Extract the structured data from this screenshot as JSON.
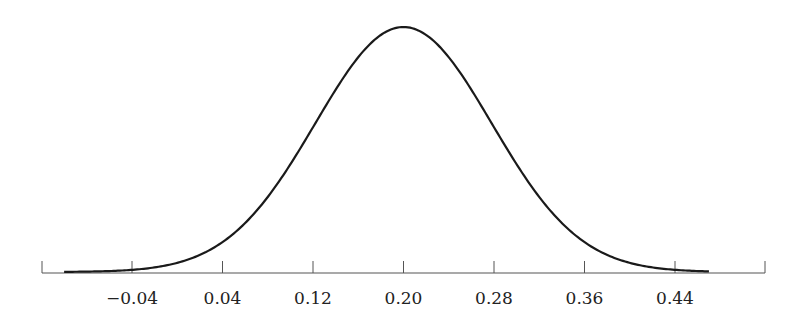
{
  "chart_data": {
    "type": "line",
    "title": "",
    "xlabel": "",
    "ylabel": "",
    "distribution": {
      "mean": 0.2,
      "sd": 0.08
    },
    "x_ticks": [
      "−0.04",
      "0.04",
      "0.12",
      "0.20",
      "0.28",
      "0.36",
      "0.44"
    ],
    "x_tick_values": [
      -0.04,
      0.04,
      0.12,
      0.2,
      0.28,
      0.36,
      0.44
    ],
    "xlim": [
      -0.12,
      0.52
    ],
    "curve_range": [
      -0.1,
      0.47
    ],
    "grid": false,
    "legend": null,
    "series": [
      {
        "name": "density",
        "x": [
          -0.1,
          -0.04,
          0.04,
          0.12,
          0.2,
          0.28,
          0.36,
          0.44,
          0.47
        ],
        "values": [
          0.011,
          0.044,
          0.135,
          0.607,
          1.0,
          0.607,
          0.135,
          0.011,
          0.003
        ]
      }
    ],
    "colors": {
      "line": "#1a1a1a",
      "axis": "#555555"
    }
  }
}
